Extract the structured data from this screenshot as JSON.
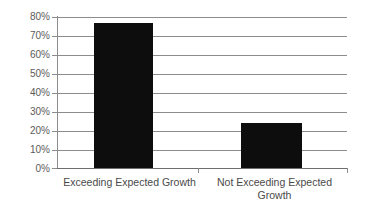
{
  "chart_data": {
    "type": "bar",
    "title": "",
    "subtitle": "",
    "xlabel": "",
    "ylabel": "",
    "categories": [
      "Exceeding Expected Growth",
      "Not Exceeding Expected Growth"
    ],
    "values": [
      77,
      24
    ],
    "ylim": [
      0,
      80
    ],
    "ytick_step": 10,
    "ytick_labels": [
      "80%",
      "70%",
      "60%",
      "50%",
      "40%",
      "30%",
      "20%",
      "10%",
      "0%"
    ],
    "ytick_values": [
      80,
      70,
      60,
      50,
      40,
      30,
      20,
      10,
      0
    ],
    "grid": true,
    "grid_axis": "y",
    "legend": false,
    "legend_position": "none",
    "series": [
      {
        "name": "Percent",
        "values": [
          77,
          24
        ]
      }
    ]
  },
  "colors": {
    "bar": "#0d0d0d",
    "gridline": "#8c8c8c",
    "axis": "#8c8c8c",
    "tick_label": "#5b5b5b",
    "category_label": "#4a4a4a",
    "background": "#ffffff"
  }
}
